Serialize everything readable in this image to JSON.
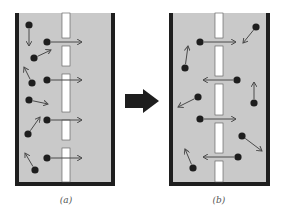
{
  "figure": {
    "panels": [
      {
        "id": "a",
        "label": "(a)",
        "box": {
          "x": 15,
          "y": 13,
          "w": 100,
          "h": 173
        },
        "membrane_x": 62,
        "membrane_w": 8,
        "gaps": [
          42,
          70,
          116,
          144
        ],
        "particles": [
          {
            "x": 29,
            "y": 25,
            "ax": 29,
            "ay": 46
          },
          {
            "x": 47,
            "y": 42,
            "ax": 82,
            "ay": 42
          },
          {
            "x": 34,
            "y": 58,
            "ax": 51,
            "ay": 50
          },
          {
            "x": 32,
            "y": 83,
            "ax": 24,
            "ay": 67
          },
          {
            "x": 47,
            "y": 80,
            "ax": 82,
            "ay": 80
          },
          {
            "x": 29,
            "y": 100,
            "ax": 48,
            "ay": 104
          },
          {
            "x": 47,
            "y": 120,
            "ax": 82,
            "ay": 120
          },
          {
            "x": 28,
            "y": 134,
            "ax": 40,
            "ay": 117
          },
          {
            "x": 47,
            "y": 158,
            "ax": 82,
            "ay": 158
          },
          {
            "x": 35,
            "y": 170,
            "ax": 25,
            "ay": 153
          }
        ]
      },
      {
        "id": "b",
        "label": "(b)",
        "box": {
          "x": 169,
          "y": 13,
          "w": 101,
          "h": 173
        },
        "membrane_x": 215,
        "membrane_w": 8,
        "gaps": [
          42,
          80,
          119,
          157
        ],
        "particles": [
          {
            "x": 200,
            "y": 42,
            "ax": 236,
            "ay": 42
          },
          {
            "x": 256,
            "y": 27,
            "ax": 243,
            "ay": 43
          },
          {
            "x": 185,
            "y": 68,
            "ax": 188,
            "ay": 46
          },
          {
            "x": 237,
            "y": 80,
            "ax": 203,
            "ay": 80
          },
          {
            "x": 198,
            "y": 97,
            "ax": 178,
            "ay": 107
          },
          {
            "x": 254,
            "y": 103,
            "ax": 254,
            "ay": 82
          },
          {
            "x": 200,
            "y": 119,
            "ax": 236,
            "ay": 119
          },
          {
            "x": 242,
            "y": 136,
            "ax": 262,
            "ay": 151
          },
          {
            "x": 238,
            "y": 157,
            "ax": 203,
            "ay": 157
          },
          {
            "x": 193,
            "y": 168,
            "ax": 185,
            "ay": 149
          }
        ]
      }
    ],
    "transition_arrow": {
      "direction": "right"
    },
    "colors": {
      "fill": "#c9c9c9",
      "wall": "#1e1e1e",
      "membrane": "#ffffff",
      "particle": "#1e1e1e",
      "arrow": "#4a4a4a",
      "big_arrow": "#1e1e1e"
    }
  }
}
